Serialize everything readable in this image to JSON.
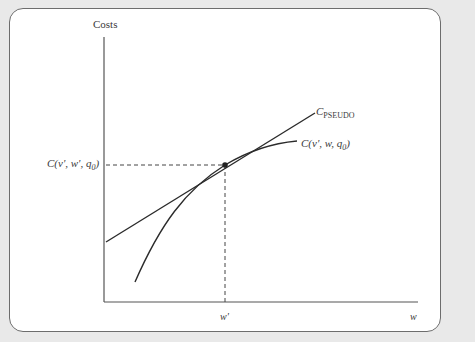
{
  "figure": {
    "y_axis_label": "Costs",
    "x_axis_label": "w",
    "x_tick_label": "w'",
    "y_tick_label": {
      "main": "C(v', w', q",
      "sub": "0",
      "close": ")"
    },
    "curve_label": {
      "main": "C(v', w, q",
      "sub": "0",
      "close": ")"
    },
    "line_label": {
      "main": "C",
      "sub": "PSEUDO"
    }
  },
  "colors": {
    "background": "#e9e9e9",
    "card": "#ffffff",
    "line": "#2b2b2b",
    "axis": "#555555"
  }
}
